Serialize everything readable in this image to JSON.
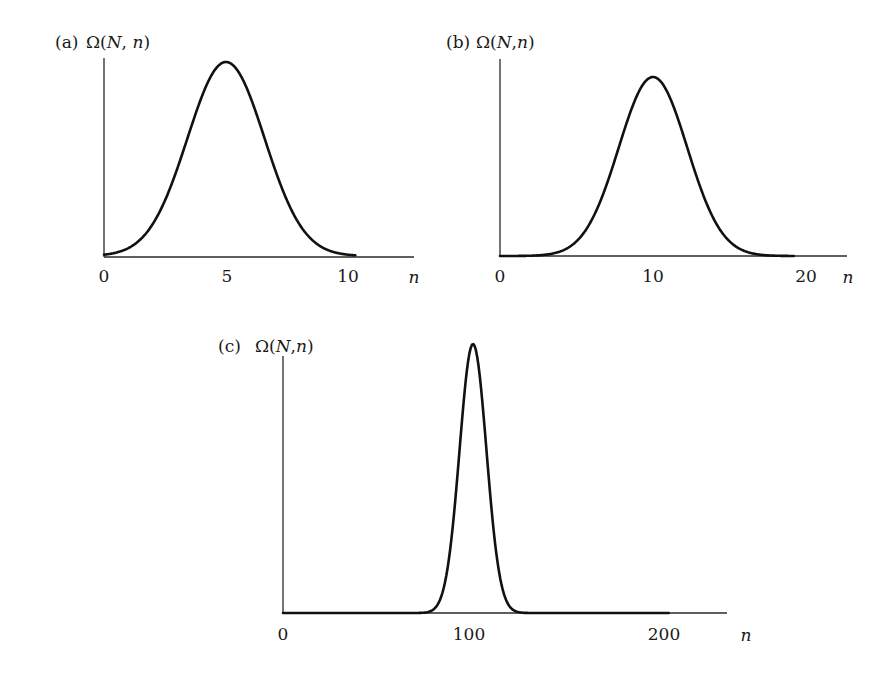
{
  "figure": {
    "background": "#ffffff",
    "line_color": "#111111"
  },
  "chart_data": [
    {
      "type": "line",
      "panel": "(a)",
      "title": "Ω(N, n)",
      "ylabel": "Ω(N, n)",
      "xlabel": "n",
      "x_ticks": [
        0,
        5,
        10
      ],
      "tick_labels": [
        "0",
        "5",
        "10"
      ],
      "distribution": "binomial",
      "N": 10,
      "peak_n": 5,
      "xlim": [
        0,
        12.8
      ],
      "curve_range": [
        0,
        10.3
      ],
      "grid": false,
      "legend": null,
      "layout": {
        "x0": 104,
        "x_per_unit": 24.4,
        "baseline": 256,
        "peak_y": 62,
        "axis_top": 58,
        "axis_right": 414
      }
    },
    {
      "type": "line",
      "panel": "(b)",
      "title": "Ω(N,n)",
      "ylabel": "Ω(N,n)",
      "xlabel": "n",
      "x_ticks": [
        0,
        10,
        20
      ],
      "tick_labels": [
        "0",
        "10",
        "20"
      ],
      "distribution": "binomial",
      "N": 20,
      "peak_n": 10,
      "xlim": [
        0,
        22.7
      ],
      "curve_range": [
        0,
        19.2
      ],
      "grid": false,
      "legend": null,
      "layout": {
        "x0": 500,
        "x_per_unit": 15.3,
        "baseline": 256,
        "peak_y": 77,
        "axis_top": 59,
        "axis_right": 847
      }
    },
    {
      "type": "line",
      "panel": "(c)",
      "title": "Ω(N,n)",
      "ylabel": "Ω(N,n)",
      "xlabel": "n",
      "x_ticks": [
        0,
        100,
        200
      ],
      "tick_labels": [
        "0",
        "100",
        "200"
      ],
      "distribution": "binomial",
      "N": 200,
      "peak_n": 100,
      "xlim": [
        0,
        231
      ],
      "curve_range": [
        0,
        203
      ],
      "grid": false,
      "legend": null,
      "layout": {
        "x0": 283,
        "x_per_unit": 1.9,
        "baseline": 613,
        "peak_y": 344,
        "axis_top": 356,
        "axis_right": 727
      }
    }
  ],
  "panels": {
    "a": {
      "letter": "(a)",
      "ylabel_omega": "Ω(",
      "ylabel_N": "N",
      "ylabel_sep": ", ",
      "ylabel_n": "n",
      "ylabel_close": ")",
      "xlabel": "n",
      "ticks": [
        "0",
        "5",
        "10"
      ]
    },
    "b": {
      "letter": "(b)",
      "ylabel_omega": "Ω(",
      "ylabel_N": "N",
      "ylabel_sep": ",",
      "ylabel_n": "n",
      "ylabel_close": ")",
      "xlabel": "n",
      "ticks": [
        "0",
        "10",
        "20"
      ]
    },
    "c": {
      "letter": "(c)",
      "ylabel_omega": "Ω(",
      "ylabel_N": "N",
      "ylabel_sep": ",",
      "ylabel_n": "n",
      "ylabel_close": ")",
      "xlabel": "n",
      "ticks": [
        "0",
        "100",
        "200"
      ]
    }
  }
}
